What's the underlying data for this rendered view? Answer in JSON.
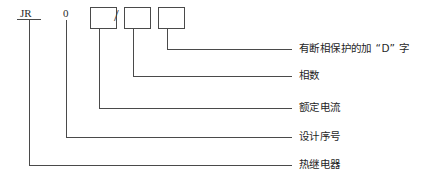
{
  "diagram": {
    "line_color": "#4a4a4a",
    "text_color": "#1f1f1f",
    "background": "#ffffff"
  },
  "code": {
    "prefix": "JR",
    "design_digit": "0",
    "separator": "/",
    "boxes": [
      {
        "id": "box-1",
        "value": ""
      },
      {
        "id": "box-2",
        "value": ""
      },
      {
        "id": "box-3",
        "value": ""
      }
    ]
  },
  "callouts": [
    {
      "id": "callout-phase-protection",
      "label": "有断相保护的加 “D” 字"
    },
    {
      "id": "callout-phase-count",
      "label": "相数"
    },
    {
      "id": "callout-rated-current",
      "label": "额定电流"
    },
    {
      "id": "callout-design-serial",
      "label": "设计序号"
    },
    {
      "id": "callout-thermal-relay",
      "label": "热继电器"
    }
  ]
}
